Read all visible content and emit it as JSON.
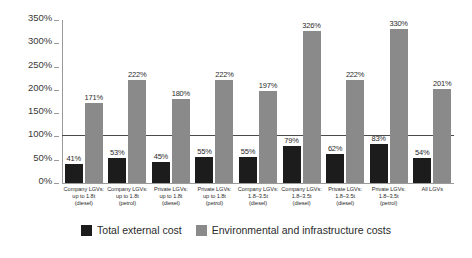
{
  "chart_data": {
    "type": "bar",
    "title": "",
    "xlabel": "",
    "ylabel": "",
    "ylim": [
      0,
      350
    ],
    "ytick_labels": [
      "0%",
      "50%",
      "100%",
      "150%",
      "200%",
      "250%",
      "300%",
      "350%"
    ],
    "ytick_values": [
      0,
      50,
      100,
      150,
      200,
      250,
      300,
      350
    ],
    "grid": false,
    "reference_line": 100,
    "legend_position": "bottom",
    "categories": [
      {
        "line1": "Company LGVs:",
        "line2": "up to 1.8t",
        "line3": "(diesel)"
      },
      {
        "line1": "Company LGVs:",
        "line2": "up to 1.8t",
        "line3": "(petrol)"
      },
      {
        "line1": "Private LGVs:",
        "line2": "up to 1.8t",
        "line3": "(diesel)"
      },
      {
        "line1": "Private LGVs:",
        "line2": "up to 1.8t",
        "line3": "(petrol)"
      },
      {
        "line1": "Company LGVs:",
        "line2": "1.8–3.5t",
        "line3": "(diesel)"
      },
      {
        "line1": "Company LGVs:",
        "line2": "1.8–3.5t",
        "line3": "(diesel)"
      },
      {
        "line1": "Private LGVs:",
        "line2": "1.8–3.5t",
        "line3": "(diesel)"
      },
      {
        "line1": "Private LGVs:",
        "line2": "1.8–3.5t",
        "line3": "(petrol)"
      },
      {
        "line1": "All LGVs",
        "line2": "",
        "line3": ""
      }
    ],
    "series": [
      {
        "name": "Total external cost",
        "color": "#1c1c1c",
        "values": [
          41,
          53,
          45,
          55,
          55,
          79,
          62,
          83,
          54
        ],
        "labels": [
          "41%",
          "53%",
          "45%",
          "55%",
          "55%",
          "79%",
          "62%",
          "83%",
          "54%"
        ]
      },
      {
        "name": "Environmental and infrastructure costs",
        "color": "#8a8a8a",
        "values": [
          171,
          222,
          180,
          222,
          197,
          326,
          222,
          330,
          201
        ],
        "labels": [
          "171%",
          "222%",
          "180%",
          "222%",
          "197%",
          "326%",
          "222%",
          "330%",
          "201%"
        ]
      }
    ]
  },
  "legend": {
    "items": [
      {
        "label": "Total external cost",
        "color": "#1c1c1c"
      },
      {
        "label": "Environmental and infrastructure costs",
        "color": "#8a8a8a"
      }
    ]
  }
}
